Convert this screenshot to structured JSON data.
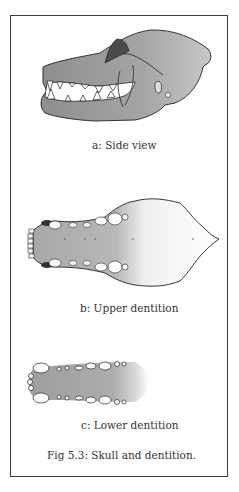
{
  "figure": {
    "title": "Fig 5.3: Skull and dentition.",
    "panels": [
      {
        "id": "a",
        "caption": "a: Side view",
        "icon": "skull-side-view-illustration"
      },
      {
        "id": "b",
        "caption": "b: Upper dentition",
        "icon": "upper-dentition-illustration"
      },
      {
        "id": "c",
        "caption": "c: Lower dentition",
        "icon": "lower-dentition-illustration"
      }
    ]
  },
  "colors": {
    "border": "#3a3a3a",
    "ink": "#222222",
    "wash": "#9a9a9a",
    "background": "#ffffff"
  }
}
